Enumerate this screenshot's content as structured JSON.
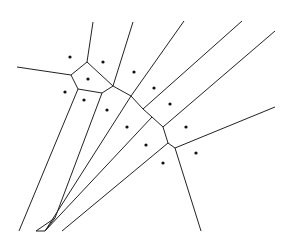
{
  "diagram": {
    "type": "voronoi",
    "width": 294,
    "height": 240,
    "background": "#ffffff",
    "edge_color": "#222222",
    "point_color": "#111111",
    "sites": [
      [
        70,
        57
      ],
      [
        103,
        62
      ],
      [
        134,
        72
      ],
      [
        88,
        79
      ],
      [
        65,
        92
      ],
      [
        84,
        100
      ],
      [
        107,
        110
      ],
      [
        154,
        88
      ],
      [
        170,
        104
      ],
      [
        127,
        127
      ],
      [
        146,
        145
      ],
      [
        163,
        163
      ],
      [
        186,
        127
      ],
      [
        196,
        153
      ]
    ],
    "vertices": {
      "A": [
        71,
        75
      ],
      "B": [
        87,
        62
      ],
      "C": [
        78,
        89
      ],
      "D": [
        102,
        93
      ],
      "E": [
        113,
        86
      ],
      "F": [
        131,
        96
      ],
      "G": [
        143,
        109
      ],
      "H": [
        152,
        117
      ],
      "I": [
        163,
        127
      ],
      "J": [
        168,
        143
      ],
      "K": [
        175,
        148
      ],
      "L": [
        55,
        218
      ],
      "M": [
        45,
        231
      ]
    },
    "edges": [
      [
        "A",
        [
          17,
          67
        ]
      ],
      [
        "A",
        "B"
      ],
      [
        "B",
        [
          93,
          22
        ]
      ],
      [
        "B",
        "E"
      ],
      [
        "A",
        "C"
      ],
      [
        "C",
        "D"
      ],
      [
        "D",
        "E"
      ],
      [
        "E",
        [
          133,
          22
        ]
      ],
      [
        "E",
        "F"
      ],
      [
        "F",
        [
          184,
          21
        ]
      ],
      [
        "F",
        "G"
      ],
      [
        "G",
        [
          242,
          21
        ]
      ],
      [
        "G",
        "H"
      ],
      [
        "H",
        "I"
      ],
      [
        "I",
        [
          275,
          31
        ]
      ],
      [
        "I",
        "J"
      ],
      [
        "J",
        "K"
      ],
      [
        "K",
        [
          275,
          107
        ]
      ],
      [
        "K",
        [
          201,
          231
        ]
      ],
      [
        "C",
        [
          19,
          231
        ]
      ],
      [
        "D",
        "L"
      ],
      [
        "L",
        [
          36,
          231
        ]
      ],
      [
        "F",
        "M"
      ],
      [
        "M",
        [
          36,
          231
        ]
      ],
      [
        "L",
        "M"
      ],
      [
        "H",
        "M"
      ],
      [
        "J",
        [
          62,
          231
        ]
      ]
    ]
  }
}
